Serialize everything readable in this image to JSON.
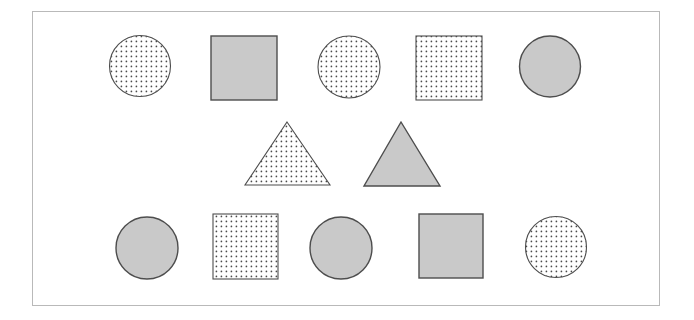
{
  "figure": {
    "title": "",
    "frame": {
      "x": 32,
      "y": 11,
      "width": 628,
      "height": 295,
      "stroke_color": "#b9b9b9",
      "stroke_width": 1,
      "background": "#ffffff"
    },
    "background_color": "#ffffff",
    "fill_solid_color": "#c9c9c9",
    "outline_color": "#4d4d4d",
    "dot_color": "#4a4a4a",
    "dot_spacing": 5,
    "dot_radius": 0.85,
    "shape_count": 12,
    "rows": [
      {
        "name": "top-row",
        "shape_count": 5,
        "shapes": [
          {
            "index": 1,
            "type": "circle",
            "fill": "dotted",
            "cx": 140,
            "cy": 66,
            "r": 30.5
          },
          {
            "index": 2,
            "type": "square",
            "fill": "solid",
            "x": 211,
            "y": 36,
            "width": 66,
            "height": 64
          },
          {
            "index": 3,
            "type": "circle",
            "fill": "dotted",
            "cx": 349,
            "cy": 67,
            "r": 31
          },
          {
            "index": 4,
            "type": "square",
            "fill": "dotted",
            "x": 416,
            "y": 36,
            "width": 66,
            "height": 64
          },
          {
            "index": 5,
            "type": "circle",
            "fill": "solid",
            "cx": 550,
            "cy": 66.5,
            "r": 30.5
          }
        ]
      },
      {
        "name": "middle-row",
        "shape_count": 2,
        "shapes": [
          {
            "index": 6,
            "type": "triangle",
            "fill": "dotted",
            "apex_x": 287,
            "apex_y": 122,
            "base_y": 185,
            "base_left_x": 245,
            "base_right_x": 330
          },
          {
            "index": 7,
            "type": "triangle",
            "fill": "solid",
            "apex_x": 401,
            "apex_y": 122,
            "base_y": 186,
            "base_left_x": 364,
            "base_right_x": 440
          }
        ]
      },
      {
        "name": "bottom-row",
        "shape_count": 5,
        "shapes": [
          {
            "index": 8,
            "type": "circle",
            "fill": "solid",
            "cx": 147,
            "cy": 248,
            "r": 31
          },
          {
            "index": 9,
            "type": "square",
            "fill": "dotted",
            "x": 213,
            "y": 214,
            "width": 65,
            "height": 65
          },
          {
            "index": 10,
            "type": "circle",
            "fill": "solid",
            "cx": 341,
            "cy": 248,
            "r": 31
          },
          {
            "index": 11,
            "type": "square",
            "fill": "solid",
            "x": 419,
            "y": 214,
            "width": 64,
            "height": 64
          },
          {
            "index": 12,
            "type": "circle",
            "fill": "dotted",
            "cx": 556,
            "cy": 247,
            "r": 30.5
          }
        ]
      }
    ]
  }
}
